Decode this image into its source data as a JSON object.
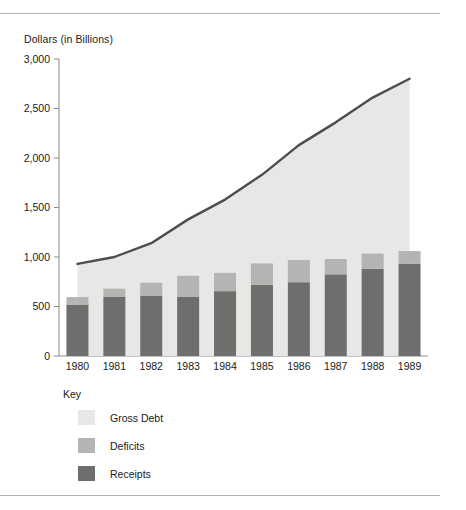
{
  "chart_data": {
    "type": "bar",
    "title": "",
    "ylabel": "Dollars (in Billions)",
    "xlabel": "",
    "categories": [
      "1980",
      "1981",
      "1982",
      "1983",
      "1984",
      "1985",
      "1986",
      "1987",
      "1988",
      "1989"
    ],
    "ylim": [
      0,
      3000
    ],
    "yticks": [
      0,
      500,
      1000,
      1500,
      2000,
      2500,
      3000
    ],
    "ytick_labels": [
      "0",
      "500",
      "1,000",
      "1,500",
      "2,000",
      "2,500",
      "3,000"
    ],
    "grid": false,
    "legend_position": "below-axis-left",
    "legend_title": "Key",
    "series": [
      {
        "name": "Gross Debt",
        "kind": "area-line",
        "color": "#e7e7e5",
        "line_color": "#4d4d4d",
        "values": [
          930,
          1000,
          1140,
          1380,
          1580,
          1830,
          2130,
          2360,
          2610,
          2800
        ]
      },
      {
        "name": "Deficits",
        "kind": "bar-stack-top",
        "color": "#b4b4b2",
        "values": [
          75,
          80,
          130,
          210,
          185,
          215,
          225,
          155,
          155,
          130
        ]
      },
      {
        "name": "Receipts",
        "kind": "bar-stack-bottom",
        "color": "#6e6e6c",
        "values": [
          520,
          600,
          610,
          600,
          655,
          720,
          745,
          825,
          880,
          930
        ]
      }
    ],
    "legend_entries": [
      {
        "label": "Gross Debt",
        "color": "#e7e7e5"
      },
      {
        "label": "Deficits",
        "color": "#b4b4b2"
      },
      {
        "label": "Receipts",
        "color": "#6e6e6c"
      }
    ],
    "axis_color": "#8a8a8a"
  }
}
